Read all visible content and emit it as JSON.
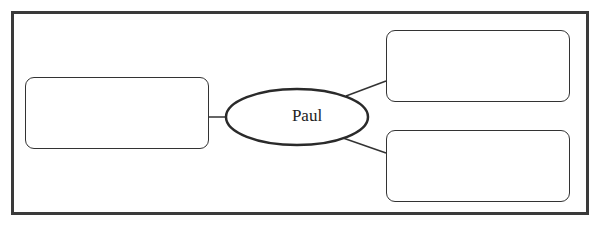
{
  "diagram": {
    "type": "concept-map",
    "center_node": {
      "label": "Paul",
      "shape": "ellipse"
    },
    "nodes": [
      {
        "id": "left",
        "label": "",
        "shape": "rounded-rect"
      },
      {
        "id": "top-right",
        "label": "",
        "shape": "rounded-rect"
      },
      {
        "id": "bottom-right",
        "label": "",
        "shape": "rounded-rect"
      }
    ],
    "edges": [
      {
        "from": "Paul",
        "to": "left"
      },
      {
        "from": "Paul",
        "to": "top-right"
      },
      {
        "from": "Paul",
        "to": "bottom-right"
      }
    ],
    "colors": {
      "stroke": "#333333",
      "frame": "#3a3a3a",
      "background": "#ffffff"
    }
  }
}
